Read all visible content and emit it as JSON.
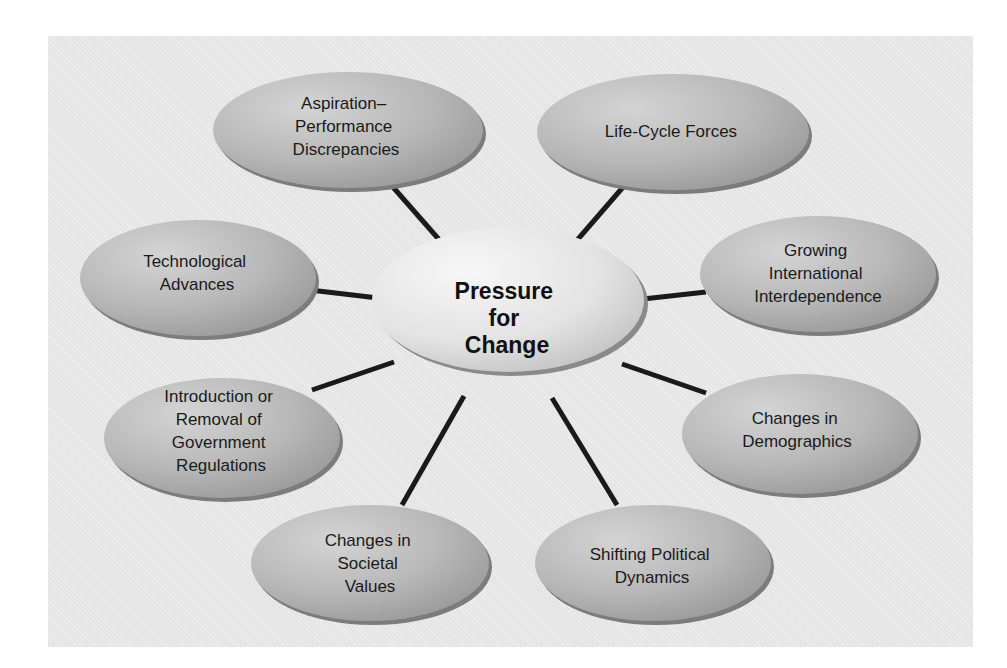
{
  "diagram": {
    "type": "hub-and-spoke",
    "center": {
      "lines": [
        "Pressure",
        "for",
        "Change"
      ]
    },
    "nodes": [
      {
        "id": "aspiration",
        "lines": [
          "Aspiration–",
          "Performance",
          "Discrepancies"
        ]
      },
      {
        "id": "life-cycle",
        "lines": [
          "Life-Cycle Forces"
        ]
      },
      {
        "id": "technological",
        "lines": [
          "Technological",
          "Advances"
        ]
      },
      {
        "id": "international",
        "lines": [
          "Growing",
          "International",
          "Interdependence"
        ]
      },
      {
        "id": "regulations",
        "lines": [
          "Introduction or",
          "Removal of",
          "Government",
          "Regulations"
        ]
      },
      {
        "id": "demographics",
        "lines": [
          "Changes in",
          "Demographics"
        ]
      },
      {
        "id": "societal",
        "lines": [
          "Changes in",
          "Societal",
          "Values"
        ]
      },
      {
        "id": "political",
        "lines": [
          "Shifting Political",
          "Dynamics"
        ]
      }
    ],
    "colors": {
      "panel": "#e9e9e9",
      "node_light": "#c9c9c9",
      "node_dark": "#9a9a9a",
      "center_light": "#f2f2f2",
      "center_dark": "#cfcfcf",
      "connector": "#1a1a1a"
    }
  }
}
